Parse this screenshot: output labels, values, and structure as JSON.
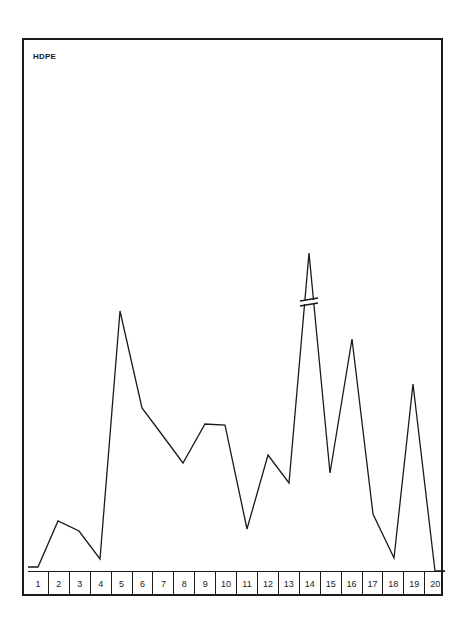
{
  "chart_data": {
    "type": "line",
    "title": "HDPE",
    "xlabel": "",
    "ylabel": "",
    "categories": [
      "1",
      "2",
      "3",
      "4",
      "5",
      "6",
      "7",
      "8",
      "9",
      "10",
      "11",
      "12",
      "13",
      "14",
      "15",
      "16",
      "17",
      "18",
      "19",
      "20"
    ],
    "values": [
      0,
      18,
      14,
      3,
      99,
      60,
      50,
      40,
      55,
      55,
      14,
      44,
      33,
      124,
      37,
      87,
      21,
      3,
      70,
      0
    ],
    "annotations": [
      "axis break marker on peak at category 14"
    ],
    "grid": false,
    "legend": "none",
    "ylim": [
      0,
      130
    ],
    "line_color": "#1a1a1a"
  },
  "plot_px": {
    "points": [
      [
        28,
        567
      ],
      [
        38,
        567
      ],
      [
        58,
        521
      ],
      [
        79,
        531
      ],
      [
        100,
        559
      ],
      [
        120,
        311
      ],
      [
        142,
        408
      ],
      [
        163,
        436
      ],
      [
        183,
        463
      ],
      [
        205,
        424
      ],
      [
        225,
        425
      ],
      [
        247,
        529
      ],
      [
        268,
        455
      ],
      [
        289,
        483
      ],
      [
        309,
        253
      ],
      [
        330,
        473
      ],
      [
        352,
        339
      ],
      [
        373,
        514
      ],
      [
        394,
        558
      ],
      [
        413,
        384
      ],
      [
        435,
        571
      ],
      [
        445,
        571
      ]
    ],
    "break": {
      "x": 309,
      "y": 302
    }
  }
}
